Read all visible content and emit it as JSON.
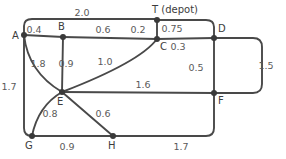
{
  "figure": {
    "kind": "weighted-undirected-graph",
    "background_color": "#ffffff",
    "edge_color": "#494949",
    "node_color": "#3a3a3a",
    "label_color": "#5a5a5a",
    "node_label_color": "#3c3c3c"
  },
  "nodes": [
    {
      "id": "A",
      "label": "A",
      "x": 24,
      "y": 35,
      "label_x": 12,
      "label_y": 39
    },
    {
      "id": "B",
      "label": "B",
      "x": 63,
      "y": 37,
      "label_x": 58,
      "label_y": 30
    },
    {
      "id": "C",
      "label": "C",
      "x": 157,
      "y": 39,
      "label_x": 160,
      "label_y": 50
    },
    {
      "id": "D",
      "label": "D",
      "x": 214,
      "y": 38,
      "label_x": 218,
      "label_y": 32
    },
    {
      "id": "E",
      "label": "E",
      "x": 62,
      "y": 92,
      "label_x": 57,
      "label_y": 105
    },
    {
      "id": "F",
      "label": "F",
      "x": 214,
      "y": 93,
      "label_x": 218,
      "label_y": 104
    },
    {
      "id": "G",
      "label": "G",
      "x": 32,
      "y": 136,
      "label_x": 25,
      "label_y": 149
    },
    {
      "id": "H",
      "label": "H",
      "x": 113,
      "y": 136,
      "label_x": 108,
      "label_y": 149
    },
    {
      "id": "T",
      "label": "T (depot)",
      "x": 157,
      "y": 20,
      "label_x": 152,
      "label_y": 13
    }
  ],
  "edges": [
    {
      "from": "A",
      "to": "T",
      "weight": "2.0",
      "label_x": 82,
      "label_y": 16,
      "path": "M 24 35 L 24 26 Q 24 19 32 19 L 157 19"
    },
    {
      "from": "A",
      "to": "B",
      "weight": "0.4",
      "label_x": 34,
      "label_y": 33,
      "path": "M 24 35 L 63 37"
    },
    {
      "from": "B",
      "to": "C",
      "weight": "0.6",
      "label_x": 103,
      "label_y": 33,
      "path": "M 63 37 L 157 39"
    },
    {
      "from": "C",
      "to": "T",
      "weight": "0.2",
      "label_x": 138,
      "label_y": 33,
      "path": "M 157 39 L 157 20"
    },
    {
      "from": "T",
      "to": "D",
      "weight": "0.75",
      "label_x": 172,
      "label_y": 32,
      "path": "M 157 20 L 206 20 Q 214 20 214 27 L 214 38"
    },
    {
      "from": "C",
      "to": "D",
      "weight": "0.3",
      "label_x": 178,
      "label_y": 50,
      "path": "M 157 39 L 214 38"
    },
    {
      "from": "D",
      "to": "F",
      "weight": "0.5",
      "label_x": 196,
      "label_y": 71,
      "path": "M 214 38 L 214 93"
    },
    {
      "from": "D",
      "to": "F",
      "weight": "1.5",
      "label_x": 266,
      "label_y": 69,
      "path": "M 214 38 L 253 38 Q 262 38 262 47 L 262 84 Q 262 93 253 93 L 214 93"
    },
    {
      "from": "A",
      "to": "E",
      "weight": "1.8",
      "label_x": 38,
      "label_y": 67,
      "path": "M 24 35 Q 28 72 62 92"
    },
    {
      "from": "B",
      "to": "E",
      "weight": "0.9",
      "label_x": 66,
      "label_y": 67,
      "path": "M 63 37 L 62 92"
    },
    {
      "from": "C",
      "to": "E",
      "weight": "1.0",
      "label_x": 105,
      "label_y": 65,
      "path": "M 157 39 Q 140 62 62 92"
    },
    {
      "from": "A",
      "to": "G",
      "weight": "1.7",
      "label_x": 9,
      "label_y": 90,
      "path": "M 24 35 L 24 128 Q 24 136 32 136"
    },
    {
      "from": "E",
      "to": "F",
      "weight": "1.6",
      "label_x": 143,
      "label_y": 88,
      "path": "M 62 92 L 214 93"
    },
    {
      "from": "E",
      "to": "G",
      "weight": "0.8",
      "label_x": 50,
      "label_y": 117,
      "path": "M 62 92 Q 38 106 32 136"
    },
    {
      "from": "E",
      "to": "H",
      "weight": "0.6",
      "label_x": 103,
      "label_y": 117,
      "path": "M 62 92 L 113 136"
    },
    {
      "from": "G",
      "to": "H",
      "weight": "0.9",
      "label_x": 67,
      "label_y": 150,
      "path": "M 32 136 L 113 136"
    },
    {
      "from": "H",
      "to": "F",
      "weight": "1.7",
      "label_x": 181,
      "label_y": 150,
      "path": "M 113 136 L 206 136 Q 214 136 214 128 L 214 93"
    }
  ]
}
